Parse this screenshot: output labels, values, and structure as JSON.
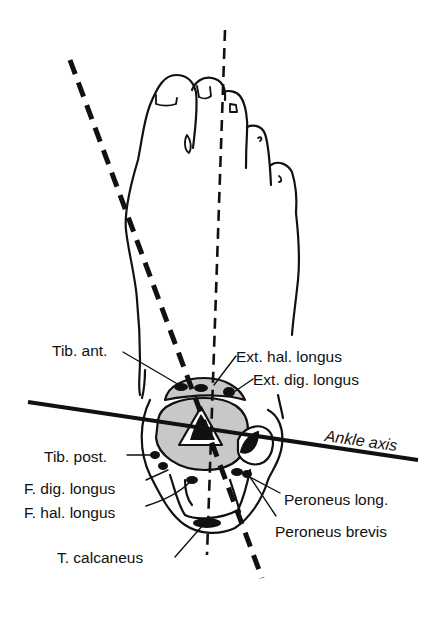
{
  "figure": {
    "colors": {
      "ink": "#111111",
      "bone_fill": "#c8c8c8",
      "background": "#ffffff"
    },
    "axes": {
      "ankle_axis_label": "Ankle axis"
    },
    "labels": {
      "tib_ant": "Tib. ant.",
      "ext_hal_longus": "Ext. hal. longus",
      "ext_dig_longus": "Ext. dig. longus",
      "tib_post": "Tib. post.",
      "f_dig_longus": "F. dig. longus",
      "f_hal_longus": "F. hal. longus",
      "peroneus_long": "Peroneus long.",
      "peroneus_brevis": "Peroneus brevis",
      "t_calcaneus": "T. calcaneus"
    }
  }
}
